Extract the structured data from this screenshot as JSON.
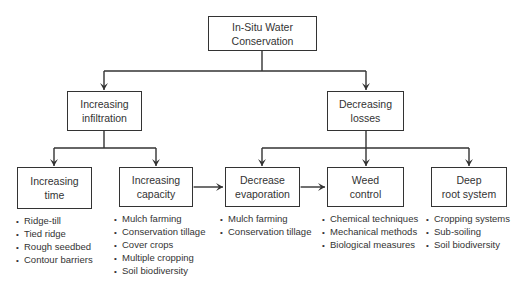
{
  "root": {
    "label": "In-Situ Water\nConservation"
  },
  "branches": [
    {
      "label": "Increasing\ninfiltration"
    },
    {
      "label": "Decreasing\nlosses"
    }
  ],
  "leaves": [
    {
      "label": "Increasing\ntime",
      "items": [
        "Ridge-till",
        "Tied ridge",
        "Rough seedbed",
        "Contour barriers"
      ]
    },
    {
      "label": "Increasing\ncapacity",
      "items": [
        "Mulch farming",
        "Conservation tillage",
        "Cover crops",
        "Multiple cropping",
        "Soil biodiversity"
      ]
    },
    {
      "label": "Decrease\nevaporation",
      "items": [
        "Mulch farming",
        "Conservation tillage"
      ]
    },
    {
      "label": "Weed\ncontrol",
      "items": [
        "Chemical techniques",
        "Mechanical methods",
        "Biological measures"
      ]
    },
    {
      "label": "Deep\nroot system",
      "items": [
        "Cropping systems",
        "Sub-soiling",
        "Soil biodiversity"
      ]
    }
  ],
  "connections": {
    "hierarchy": "root -> branches; branch[0] -> leaves[0,1]; branch[1] -> leaves[2,3,4]",
    "bidirectional": [
      "Increasing capacity <-> Decrease evaporation",
      "Decrease evaporation <-> Weed control"
    ]
  },
  "colors": {
    "line": "#333333",
    "background": "#ffffff"
  }
}
